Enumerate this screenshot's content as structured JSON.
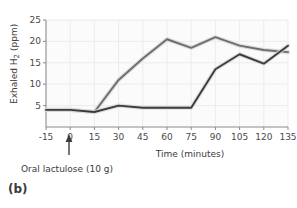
{
  "figure": {
    "panel_label": "(b)",
    "annotation": "Oral lactulose (10 g)",
    "annotation_icon": "up-arrow-icon"
  },
  "chart_data": {
    "type": "line",
    "title": "",
    "xlabel": "Time (minutes)",
    "ylabel": "Exhaled H2 (ppm)",
    "ylabel_main": "Exhaled H",
    "ylabel_sub": "2",
    "ylabel_unit": " (ppm)",
    "x": [
      -15,
      0,
      15,
      30,
      45,
      60,
      75,
      90,
      105,
      120,
      135
    ],
    "xticklabels": [
      "-15",
      "0",
      "15",
      "30",
      "45",
      "60",
      "75",
      "90",
      "105",
      "120",
      "135"
    ],
    "yticks": [
      5,
      10,
      15,
      20,
      25
    ],
    "yticklabels": [
      "5",
      "10",
      "15",
      "20",
      "25"
    ],
    "xlim": [
      -15,
      135
    ],
    "ylim": [
      0,
      25
    ],
    "grid": true,
    "legend": "none",
    "annotations": [
      {
        "text": "Oral lactulose (10 g)",
        "x": 0,
        "type": "arrow-up"
      }
    ],
    "series": [
      {
        "name": "upper-curve",
        "color": "#6e6e6e",
        "values": [
          4.0,
          4.0,
          3.5,
          11.0,
          16.0,
          20.5,
          18.5,
          21.0,
          19.0,
          18.0,
          17.5
        ]
      },
      {
        "name": "lower-curve",
        "color": "#3c3c3c",
        "values": [
          4.0,
          4.0,
          3.5,
          5.0,
          4.5,
          4.5,
          4.5,
          13.5,
          17.0,
          14.8,
          19.0
        ]
      }
    ]
  },
  "colors": {
    "upper_line": "#6e6e6e",
    "lower_line": "#3c3c3c",
    "plot_background": "#fbfbfb",
    "grid": "#ececec",
    "axis": "#888888",
    "text": "#3c3c3c"
  }
}
